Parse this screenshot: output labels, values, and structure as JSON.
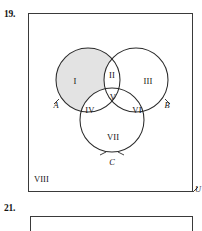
{
  "exercises": [
    {
      "number": "19."
    },
    {
      "number": "21."
    }
  ],
  "diagram": {
    "type": "venn-three-set",
    "universal_set_label": "U",
    "set_labels": [
      {
        "name": "A",
        "text": "A"
      },
      {
        "name": "B",
        "text": "B"
      },
      {
        "name": "C",
        "text": "C"
      }
    ],
    "regions": [
      {
        "id": "I",
        "text": "I",
        "description": "A only",
        "shaded": true
      },
      {
        "id": "II",
        "text": "II",
        "description": "A and B only",
        "shaded": false
      },
      {
        "id": "III",
        "text": "III",
        "description": "B only",
        "shaded": false
      },
      {
        "id": "IV",
        "text": "IV",
        "description": "A and C only",
        "shaded": false
      },
      {
        "id": "V",
        "text": "V",
        "description": "A and B and C",
        "shaded": false
      },
      {
        "id": "VI",
        "text": "VI",
        "description": "B and C only",
        "shaded": false
      },
      {
        "id": "VII",
        "text": "VII",
        "description": "C only",
        "shaded": false
      },
      {
        "id": "VIII",
        "text": "VIII",
        "description": "outside all sets",
        "shaded": false
      }
    ],
    "colors": {
      "shade_fill": "#e3e3e3",
      "stroke": "#2a2a2a",
      "box_stroke": "#3a3a3a",
      "text": "#141414",
      "background": "#ffffff"
    }
  }
}
